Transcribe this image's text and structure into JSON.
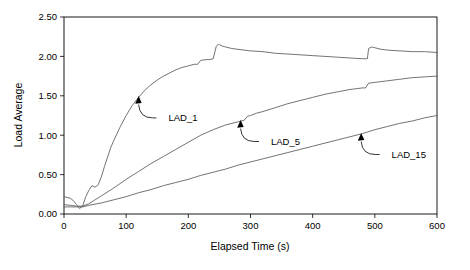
{
  "chart_data": {
    "type": "line",
    "title": "",
    "xlabel": "Elapsed Time (s)",
    "ylabel": "Load Average",
    "xlim": [
      0,
      600
    ],
    "ylim": [
      0.0,
      2.5
    ],
    "xticks": [
      0,
      100,
      200,
      300,
      400,
      500,
      600
    ],
    "yticks": [
      0.0,
      0.5,
      1.0,
      1.5,
      2.0,
      2.5
    ],
    "xtick_labels": [
      "0",
      "100",
      "200",
      "300",
      "400",
      "500",
      "600"
    ],
    "ytick_labels": [
      "0.00",
      "0.50",
      "1.00",
      "1.50",
      "2.00",
      "2.50"
    ],
    "grid": false,
    "legend_position": "inline-annotations",
    "line_color": "#5a5a5a",
    "frame_color": "#000000",
    "series": [
      {
        "name": "LAD_1",
        "x": [
          0,
          5,
          10,
          15,
          20,
          25,
          30,
          35,
          40,
          45,
          50,
          55,
          60,
          65,
          70,
          75,
          80,
          90,
          100,
          110,
          120,
          130,
          140,
          150,
          160,
          170,
          180,
          190,
          200,
          210,
          215,
          220,
          230,
          235,
          240,
          245,
          248,
          250,
          255,
          260,
          270,
          280,
          300,
          320,
          340,
          360,
          380,
          400,
          420,
          440,
          460,
          480,
          488,
          490,
          495,
          500,
          510,
          520,
          540,
          560,
          580,
          600
        ],
        "y": [
          0.22,
          0.21,
          0.2,
          0.17,
          0.12,
          0.07,
          0.1,
          0.22,
          0.3,
          0.36,
          0.34,
          0.37,
          0.47,
          0.6,
          0.72,
          0.84,
          0.93,
          1.1,
          1.25,
          1.38,
          1.48,
          1.57,
          1.64,
          1.7,
          1.75,
          1.79,
          1.83,
          1.86,
          1.88,
          1.9,
          1.9,
          1.95,
          1.96,
          1.96,
          1.97,
          2.13,
          2.15,
          2.15,
          2.13,
          2.12,
          2.1,
          2.09,
          2.07,
          2.06,
          2.04,
          2.03,
          2.02,
          2.01,
          2.0,
          1.99,
          1.98,
          1.97,
          1.97,
          2.1,
          2.12,
          2.11,
          2.09,
          2.08,
          2.07,
          2.06,
          2.06,
          2.05
        ]
      },
      {
        "name": "LAD_5",
        "x": [
          0,
          10,
          20,
          30,
          40,
          50,
          60,
          80,
          100,
          120,
          140,
          160,
          180,
          200,
          220,
          240,
          260,
          270,
          280,
          290,
          295,
          300,
          310,
          320,
          340,
          360,
          380,
          400,
          420,
          440,
          460,
          470,
          480,
          485,
          490,
          500,
          520,
          540,
          560,
          580,
          600
        ],
        "y": [
          0.12,
          0.11,
          0.1,
          0.1,
          0.13,
          0.18,
          0.23,
          0.33,
          0.44,
          0.54,
          0.64,
          0.73,
          0.82,
          0.91,
          1.0,
          1.07,
          1.13,
          1.15,
          1.17,
          1.19,
          1.24,
          1.25,
          1.28,
          1.3,
          1.35,
          1.4,
          1.44,
          1.48,
          1.52,
          1.55,
          1.58,
          1.59,
          1.6,
          1.6,
          1.66,
          1.67,
          1.69,
          1.71,
          1.73,
          1.74,
          1.75
        ]
      },
      {
        "name": "LAD_15",
        "x": [
          0,
          10,
          20,
          30,
          40,
          60,
          80,
          100,
          120,
          140,
          160,
          180,
          200,
          220,
          240,
          260,
          280,
          300,
          320,
          340,
          360,
          380,
          400,
          420,
          440,
          460,
          480,
          500,
          520,
          540,
          560,
          580,
          600
        ],
        "y": [
          0.09,
          0.09,
          0.09,
          0.09,
          0.11,
          0.14,
          0.18,
          0.22,
          0.27,
          0.31,
          0.36,
          0.4,
          0.44,
          0.49,
          0.53,
          0.57,
          0.62,
          0.66,
          0.7,
          0.74,
          0.78,
          0.82,
          0.86,
          0.9,
          0.94,
          0.98,
          1.02,
          1.07,
          1.11,
          1.15,
          1.18,
          1.22,
          1.25
        ]
      }
    ],
    "annotations": [
      {
        "label": "LAD_1",
        "point_x": 120,
        "point_y": 1.49,
        "text_x": 168,
        "text_y": 1.22
      },
      {
        "label": "LAD_5",
        "point_x": 284,
        "point_y": 1.185,
        "text_x": 333,
        "text_y": 0.92
      },
      {
        "label": "LAD_15",
        "point_x": 478,
        "point_y": 1.02,
        "text_x": 527,
        "text_y": 0.755
      }
    ]
  }
}
